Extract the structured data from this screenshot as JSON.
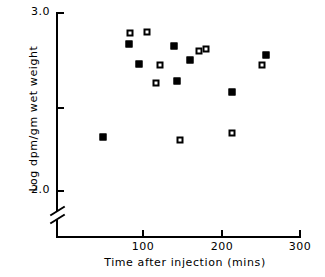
{
  "chart_data": {
    "type": "scatter",
    "title": "",
    "xlabel": "Time after injection (mins)",
    "ylabel": "Log dpm/gm  wet weight",
    "xlim": [
      0,
      300
    ],
    "ylim": [
      2.0,
      3.0
    ],
    "y_axis_break": true,
    "grid": false,
    "legend": "none",
    "x_ticks": [
      {
        "value": 100,
        "label": "100"
      },
      {
        "value": 200,
        "label": "200"
      },
      {
        "value": 300,
        "label": "300"
      }
    ],
    "y_ticks": [
      {
        "value": 3.0,
        "label": "3.0"
      },
      {
        "value": 2.5,
        "label": ""
      },
      {
        "value": 2.0,
        "label": "2.0"
      }
    ],
    "series": [
      {
        "name": "filled-square",
        "marker": "filled-square",
        "points": [
          {
            "x": 50,
            "y": 2.3
          },
          {
            "x": 84,
            "y": 2.82
          },
          {
            "x": 96,
            "y": 2.71
          },
          {
            "x": 141,
            "y": 2.81
          },
          {
            "x": 145,
            "y": 2.61
          },
          {
            "x": 161,
            "y": 2.73
          },
          {
            "x": 215,
            "y": 2.55
          },
          {
            "x": 258,
            "y": 2.76
          }
        ]
      },
      {
        "name": "open-square",
        "marker": "open-square",
        "points": [
          {
            "x": 85,
            "y": 2.88
          },
          {
            "x": 106,
            "y": 2.89
          },
          {
            "x": 118,
            "y": 2.6
          },
          {
            "x": 123,
            "y": 2.7
          },
          {
            "x": 148,
            "y": 2.28
          },
          {
            "x": 172,
            "y": 2.78
          },
          {
            "x": 182,
            "y": 2.79
          },
          {
            "x": 215,
            "y": 2.32
          },
          {
            "x": 253,
            "y": 2.7
          }
        ]
      }
    ]
  },
  "axis": {
    "y_top_label": "3.0",
    "y_bottom_label": "2.0",
    "x_tick_1": "100",
    "x_tick_2": "200",
    "x_tick_3": "300",
    "x_title": "Time after injection (mins)",
    "y_title": "Log dpm/gm  wet weight"
  },
  "colors": {
    "ink": "#000000",
    "background": "#ffffff"
  }
}
